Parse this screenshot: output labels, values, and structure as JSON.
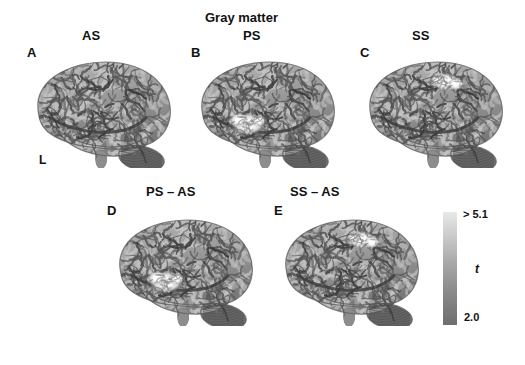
{
  "figure": {
    "title": "Gray matter",
    "hemisphere_label": "L"
  },
  "panels": [
    {
      "letter": "A",
      "condition": "AS",
      "row": "top",
      "activation": "none"
    },
    {
      "letter": "B",
      "condition": "PS",
      "row": "top",
      "activation": "superior-temporal"
    },
    {
      "letter": "C",
      "condition": "SS",
      "row": "top",
      "activation": "superior-frontal"
    },
    {
      "letter": "D",
      "condition": "PS – AS",
      "row": "bottom",
      "activation": "superior-temporal"
    },
    {
      "letter": "E",
      "condition": "SS – AS",
      "row": "bottom",
      "activation": "superior-frontal"
    }
  ],
  "colorbar": {
    "max_label": "> 5.1",
    "min_label": "2.0",
    "unit": "t",
    "top_color": "#e8e8e8",
    "bottom_color": "#6e6e6e"
  },
  "chart_data": {
    "type": "heatmap",
    "title": "Gray matter",
    "panels": [
      {
        "letter": "A",
        "label": "AS",
        "clusters": []
      },
      {
        "letter": "B",
        "label": "PS",
        "clusters": [
          {
            "region": "superior temporal",
            "peak_t": 5.1
          }
        ]
      },
      {
        "letter": "C",
        "label": "SS",
        "clusters": [
          {
            "region": "superior frontal",
            "peak_t": 5.1
          }
        ]
      },
      {
        "letter": "D",
        "label": "PS – AS",
        "clusters": [
          {
            "region": "superior temporal",
            "peak_t": 5.1
          }
        ]
      },
      {
        "letter": "E",
        "label": "SS – AS",
        "clusters": [
          {
            "region": "superior frontal",
            "peak_t": 5.1
          }
        ]
      }
    ],
    "colorbar": {
      "min": 2.0,
      "max": 5.1,
      "unit": "t",
      "max_label": "> 5.1",
      "min_label": "2.0"
    },
    "xlabel": "",
    "ylabel": "",
    "legend_position": "right"
  }
}
